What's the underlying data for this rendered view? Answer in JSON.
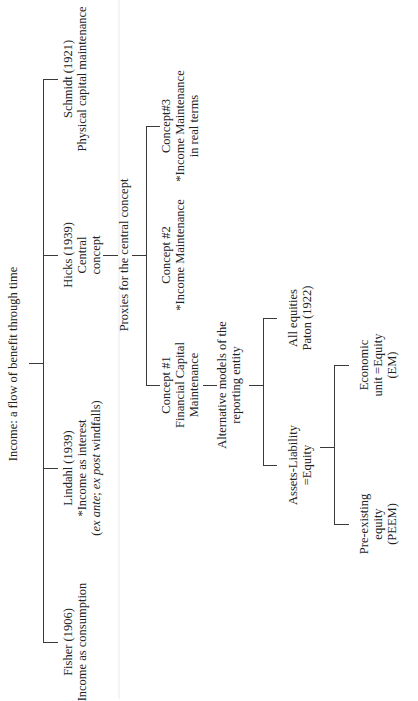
{
  "diagram": {
    "title": "Income: a flow of benefit through time",
    "root_branches": [
      {
        "id": "fisher",
        "lines": [
          "Fisher (1906)",
          "Income as consumption"
        ]
      },
      {
        "id": "lindahl",
        "lines": [
          "Lindahl (1939)",
          "*Income as interest"
        ],
        "note_prefix": "(",
        "note_ital_1": "ex ante",
        "note_mid": "; ",
        "note_ital_2": "ex post",
        "note_suffix": " windfalls)"
      },
      {
        "id": "hicks",
        "lines": [
          "Hicks (1939)",
          "Central",
          "concept"
        ]
      },
      {
        "id": "schmidt",
        "lines": [
          "Schmidt (1921)",
          "Physical capital maintenance"
        ]
      }
    ],
    "proxies_label": "Proxies for the central concept",
    "concepts": [
      {
        "id": "concept1",
        "lines": [
          "Concept #1",
          "Financial Capital",
          "Maintenance"
        ]
      },
      {
        "id": "concept2",
        "lines": [
          "Concept #2",
          "*Income Maintenance"
        ]
      },
      {
        "id": "concept3",
        "lines": [
          "Concept#3",
          "*Income Maintenance",
          "in real terms"
        ]
      }
    ],
    "alt_models_label": [
      "Alternative models of the",
      "reporting entity"
    ],
    "entity_models": [
      {
        "id": "assets_liability",
        "lines": [
          "Assets-Liability",
          "=Equity"
        ]
      },
      {
        "id": "all_equities",
        "lines": [
          "All equities",
          "Paton (1922)"
        ]
      }
    ],
    "equity_models": [
      {
        "id": "peem",
        "lines": [
          "Pre-existing",
          "equity",
          "(PEEM)"
        ]
      },
      {
        "id": "em",
        "lines": [
          "Economic",
          "unit =Equity",
          "(EM)"
        ]
      }
    ]
  }
}
